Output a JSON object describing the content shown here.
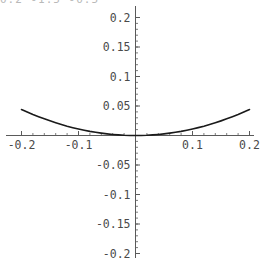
{
  "caption": {
    "clipped_text": "0.2 -1.5  -0.5",
    "note": "partially cropped text at top edge"
  },
  "chart_data": {
    "type": "line",
    "title": "",
    "subtitle": "",
    "xlabel": "",
    "ylabel": "",
    "xlim": [
      -0.2,
      0.2
    ],
    "ylim": [
      -0.2,
      0.2
    ],
    "grid": false,
    "legend": false,
    "axes_style": "crossing-at-origin",
    "x_major_ticks": [
      -0.2,
      -0.1,
      0.1,
      0.2
    ],
    "x_tick_labels": [
      "-0.2",
      "-0.1",
      "0.1",
      "0.2"
    ],
    "x_minor_tick_step": 0.02,
    "y_major_ticks": [
      -0.2,
      -0.15,
      -0.1,
      -0.05,
      0.05,
      0.1,
      0.15,
      0.2
    ],
    "y_tick_labels": [
      "-0.2",
      "-0.15",
      "-0.1",
      "-0.05",
      "0.05",
      "0.1",
      "0.15",
      "0.2"
    ],
    "y_minor_tick_step": 0.01,
    "series": [
      {
        "name": "y = 1.1 x^2",
        "color": "#1a1a1a",
        "linewidth": 1.6,
        "x": [
          -0.2,
          -0.19,
          -0.18,
          -0.17,
          -0.16,
          -0.15,
          -0.14,
          -0.13,
          -0.12,
          -0.11,
          -0.1,
          -0.09,
          -0.08,
          -0.07,
          -0.06,
          -0.05,
          -0.04,
          -0.03,
          -0.02,
          -0.01,
          0.0,
          0.01,
          0.02,
          0.03,
          0.04,
          0.05,
          0.06,
          0.07,
          0.08,
          0.09,
          0.1,
          0.11,
          0.12,
          0.13,
          0.14,
          0.15,
          0.16,
          0.17,
          0.18,
          0.19,
          0.2
        ],
        "y": [
          0.044,
          0.0397,
          0.0356,
          0.0318,
          0.0282,
          0.0248,
          0.0216,
          0.0186,
          0.0158,
          0.0133,
          0.011,
          0.0089,
          0.007,
          0.0054,
          0.004,
          0.0028,
          0.0018,
          0.001,
          0.0004,
          0.0001,
          0.0,
          0.0001,
          0.0004,
          0.001,
          0.0018,
          0.0028,
          0.004,
          0.0054,
          0.007,
          0.0089,
          0.011,
          0.0133,
          0.0158,
          0.0186,
          0.0216,
          0.0248,
          0.0282,
          0.0318,
          0.0356,
          0.0397,
          0.044
        ]
      }
    ],
    "annotations": []
  },
  "colors": {
    "axis": "#5a5a5a",
    "curve": "#1a1a1a",
    "tick_label": "#4a4a4a",
    "background": "#ffffff"
  }
}
